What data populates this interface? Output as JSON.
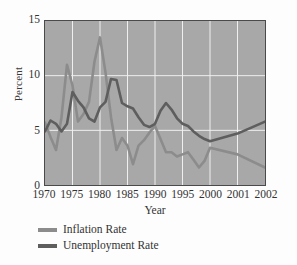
{
  "chart_data": {
    "type": "line",
    "title": "",
    "xlabel": "Year",
    "ylabel": "Percent",
    "xlim": [
      1970,
      2002
    ],
    "ylim": [
      0,
      15
    ],
    "grid": true,
    "legend_position": "below",
    "xticks": [
      1970,
      1975,
      1980,
      1985,
      1990,
      1995,
      2000,
      2001,
      2002
    ],
    "xtick_labels": [
      "1970",
      "1975",
      "1980",
      "1985",
      "1990",
      "1995",
      "2000",
      "2001",
      "2002"
    ],
    "yticks": [
      0,
      5,
      10,
      15
    ],
    "ytick_labels": [
      "0",
      "5",
      "10",
      "15"
    ],
    "x": [
      1970,
      1971,
      1972,
      1973,
      1974,
      1975,
      1976,
      1977,
      1978,
      1979,
      1980,
      1981,
      1982,
      1983,
      1984,
      1985,
      1986,
      1987,
      1988,
      1989,
      1990,
      1991,
      1992,
      1993,
      1994,
      1995,
      1996,
      1997,
      1998,
      1999,
      2000,
      2001,
      2002
    ],
    "series": [
      {
        "name": "Inflation Rate",
        "color": "#8c8c8c",
        "values": [
          5.7,
          4.4,
          3.2,
          6.2,
          11.0,
          9.1,
          5.8,
          6.5,
          7.6,
          11.3,
          13.5,
          10.3,
          6.2,
          3.2,
          4.3,
          3.6,
          1.9,
          3.6,
          4.1,
          4.8,
          5.4,
          4.2,
          3.0,
          3.0,
          2.6,
          2.8,
          3.0,
          2.3,
          1.6,
          2.2,
          3.4,
          2.8,
          1.6
        ]
      },
      {
        "name": "Unemployment Rate",
        "color": "#5e5e5e",
        "values": [
          4.9,
          5.9,
          5.6,
          4.9,
          5.6,
          8.5,
          7.7,
          7.1,
          6.1,
          5.8,
          7.1,
          7.6,
          9.7,
          9.6,
          7.5,
          7.2,
          7.0,
          6.2,
          5.5,
          5.3,
          5.6,
          6.8,
          7.5,
          6.9,
          6.1,
          5.6,
          5.4,
          4.9,
          4.5,
          4.2,
          4.0,
          4.7,
          5.8
        ]
      }
    ]
  },
  "legend": {
    "items": [
      {
        "label": "Inflation Rate",
        "color": "#8c8c8c"
      },
      {
        "label": "Unemployment Rate",
        "color": "#5e5e5e"
      }
    ]
  },
  "axes": {
    "ylabel": "Percent",
    "xlabel": "Year"
  },
  "style": {
    "plot_background": "#a8a8a8",
    "grid_color": "#f0f0f0",
    "frame_color": "#4a4a4a",
    "page_background": "#fdfdfd"
  }
}
